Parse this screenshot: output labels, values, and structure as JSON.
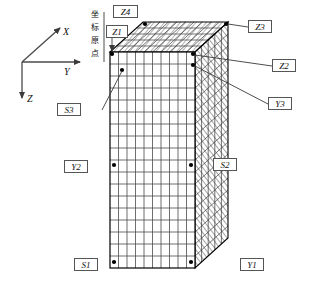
{
  "figure": {
    "type": "engineering-mesh-diagram"
  },
  "axes": {
    "origin_note_cn": "坐标原点",
    "origin_note_chars": [
      "坐",
      "标",
      "原",
      "点"
    ],
    "x_label": "X",
    "y_label": "Y",
    "z_label": "Z"
  },
  "labels": {
    "z4": "Z4",
    "z1": "Z1",
    "z3": "Z3",
    "z2": "Z2",
    "y3": "Y3",
    "y2": "Y2",
    "y1": "Y1",
    "s3": "S3",
    "s2": "S2",
    "s1": "S1"
  },
  "colors": {
    "line": "#000000",
    "grid_front": "#4a4a4a",
    "grid_shaded": "#6b6b6b",
    "label_border": "#555555",
    "background": "#ffffff"
  },
  "mesh": {
    "front_columns": 10,
    "front_rows": 18,
    "top_depth_rows": 5,
    "side_depth_columns": 5
  }
}
